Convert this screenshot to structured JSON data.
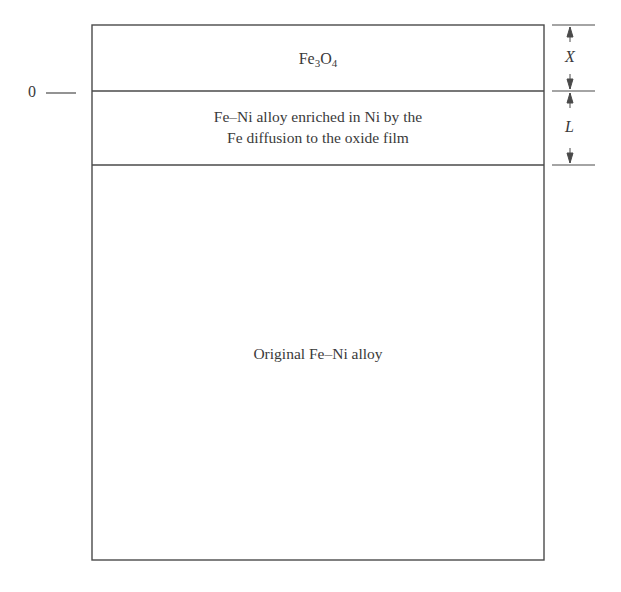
{
  "diagram": {
    "type": "layered cross-section",
    "layers": [
      {
        "id": "oxide",
        "label_main": "Fe",
        "label_sub1": "3",
        "label_mid": "O",
        "label_sub2": "4",
        "label": "Fe3O4"
      },
      {
        "id": "enriched",
        "line1": "Fe–Ni alloy enriched in Ni by the",
        "line2": "Fe diffusion to the oxide film"
      },
      {
        "id": "original",
        "label": "Original Fe–Ni alloy"
      }
    ],
    "origin_label": "0",
    "dimensions": [
      {
        "label": "X",
        "spans": "oxide"
      },
      {
        "label": "L",
        "spans": "enriched"
      }
    ],
    "colors": {
      "line": "#4a4a4a",
      "text": "#3a3a3a",
      "background": "#ffffff"
    }
  }
}
